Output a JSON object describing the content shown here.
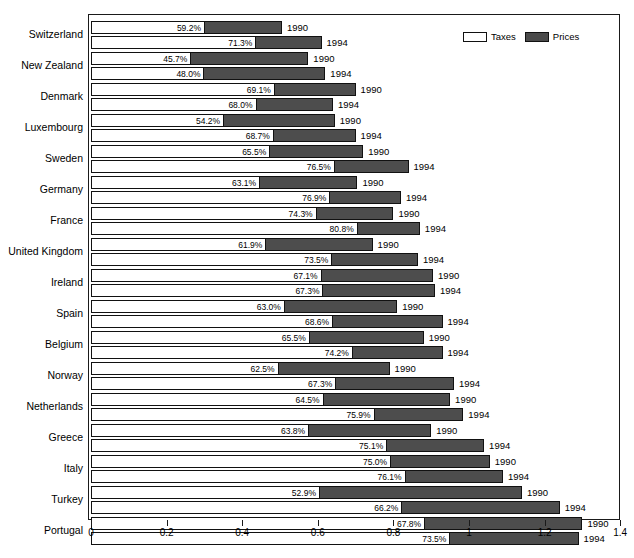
{
  "chart_data": {
    "type": "bar",
    "orientation": "horizontal",
    "stacked": true,
    "title": "",
    "xlabel": "",
    "ylabel": "",
    "xlim": [
      0,
      1.4
    ],
    "xticks": [
      "0",
      "0.2",
      "0.4",
      "0.6",
      "0.8",
      "1",
      "1.2",
      "1.4"
    ],
    "xtick_values": [
      0,
      0.2,
      0.4,
      0.6,
      0.8,
      1.0,
      1.2,
      1.4
    ],
    "grid": false,
    "legend": {
      "position": "top-right",
      "entries": [
        {
          "label": "Taxes",
          "color": "#ffffff",
          "swatch": "taxes-swatch"
        },
        {
          "label": "Prices",
          "color": "#4d4d4d",
          "swatch": "prices-swatch"
        }
      ]
    },
    "series": [
      {
        "name": "Taxes",
        "color": "#ffffff"
      },
      {
        "name": "Prices",
        "color": "#4d4d4d"
      }
    ],
    "categories": [
      "Switzerland",
      "New Zealand",
      "Denmark",
      "Luxembourg",
      "Sweden",
      "Germany",
      "France",
      "United Kingdom",
      "Ireland",
      "Spain",
      "Belgium",
      "Norway",
      "Netherlands",
      "Greece",
      "Italy",
      "Turkey",
      "Portugal"
    ],
    "rows": [
      {
        "country": "Switzerland",
        "year": "1990",
        "tax_pct": "59.2%",
        "tax_share": 0.592,
        "total": 0.505
      },
      {
        "country": "Switzerland",
        "year": "1994",
        "tax_pct": "71.3%",
        "tax_share": 0.713,
        "total": 0.61
      },
      {
        "country": "New Zealand",
        "year": "1990",
        "tax_pct": "45.7%",
        "tax_share": 0.457,
        "total": 0.575
      },
      {
        "country": "New Zealand",
        "year": "1994",
        "tax_pct": "48.0%",
        "tax_share": 0.48,
        "total": 0.62
      },
      {
        "country": "Denmark",
        "year": "1990",
        "tax_pct": "69.1%",
        "tax_share": 0.691,
        "total": 0.7
      },
      {
        "country": "Denmark",
        "year": "1994",
        "tax_pct": "68.0%",
        "tax_share": 0.68,
        "total": 0.64
      },
      {
        "country": "Luxembourg",
        "year": "1990",
        "tax_pct": "54.2%",
        "tax_share": 0.542,
        "total": 0.645
      },
      {
        "country": "Luxembourg",
        "year": "1994",
        "tax_pct": "68.7%",
        "tax_share": 0.687,
        "total": 0.7
      },
      {
        "country": "Sweden",
        "year": "1990",
        "tax_pct": "65.5%",
        "tax_share": 0.655,
        "total": 0.72
      },
      {
        "country": "Sweden",
        "year": "1994",
        "tax_pct": "76.5%",
        "tax_share": 0.765,
        "total": 0.84
      },
      {
        "country": "Germany",
        "year": "1990",
        "tax_pct": "63.1%",
        "tax_share": 0.631,
        "total": 0.705
      },
      {
        "country": "Germany",
        "year": "1994",
        "tax_pct": "76.9%",
        "tax_share": 0.769,
        "total": 0.82
      },
      {
        "country": "France",
        "year": "1990",
        "tax_pct": "74.3%",
        "tax_share": 0.743,
        "total": 0.8
      },
      {
        "country": "France",
        "year": "1994",
        "tax_pct": "80.8%",
        "tax_share": 0.808,
        "total": 0.87
      },
      {
        "country": "United Kingdom",
        "year": "1990",
        "tax_pct": "61.9%",
        "tax_share": 0.619,
        "total": 0.745
      },
      {
        "country": "United Kingdom",
        "year": "1994",
        "tax_pct": "73.5%",
        "tax_share": 0.735,
        "total": 0.865
      },
      {
        "country": "Ireland",
        "year": "1990",
        "tax_pct": "67.1%",
        "tax_share": 0.671,
        "total": 0.905
      },
      {
        "country": "Ireland",
        "year": "1994",
        "tax_pct": "67.3%",
        "tax_share": 0.673,
        "total": 0.91
      },
      {
        "country": "Spain",
        "year": "1990",
        "tax_pct": "63.0%",
        "tax_share": 0.63,
        "total": 0.81
      },
      {
        "country": "Spain",
        "year": "1994",
        "tax_pct": "68.6%",
        "tax_share": 0.686,
        "total": 0.93
      },
      {
        "country": "Belgium",
        "year": "1990",
        "tax_pct": "65.5%",
        "tax_share": 0.655,
        "total": 0.88
      },
      {
        "country": "Belgium",
        "year": "1994",
        "tax_pct": "74.2%",
        "tax_share": 0.742,
        "total": 0.93
      },
      {
        "country": "Norway",
        "year": "1990",
        "tax_pct": "62.5%",
        "tax_share": 0.625,
        "total": 0.79
      },
      {
        "country": "Norway",
        "year": "1994",
        "tax_pct": "67.3%",
        "tax_share": 0.673,
        "total": 0.96
      },
      {
        "country": "Netherlands",
        "year": "1990",
        "tax_pct": "64.5%",
        "tax_share": 0.645,
        "total": 0.95
      },
      {
        "country": "Netherlands",
        "year": "1994",
        "tax_pct": "75.9%",
        "tax_share": 0.759,
        "total": 0.985
      },
      {
        "country": "Greece",
        "year": "1990",
        "tax_pct": "63.8%",
        "tax_share": 0.638,
        "total": 0.9
      },
      {
        "country": "Greece",
        "year": "1994",
        "tax_pct": "75.1%",
        "tax_share": 0.751,
        "total": 1.04
      },
      {
        "country": "Italy",
        "year": "1990",
        "tax_pct": "75.0%",
        "tax_share": 0.75,
        "total": 1.055
      },
      {
        "country": "Italy",
        "year": "1994",
        "tax_pct": "76.1%",
        "tax_share": 0.761,
        "total": 1.09
      },
      {
        "country": "Turkey",
        "year": "1990",
        "tax_pct": "52.9%",
        "tax_share": 0.529,
        "total": 1.14
      },
      {
        "country": "Turkey",
        "year": "1994",
        "tax_pct": "66.2%",
        "tax_share": 0.662,
        "total": 1.24
      },
      {
        "country": "Portugal",
        "year": "1990",
        "tax_pct": "67.8%",
        "tax_share": 0.678,
        "total": 1.3
      },
      {
        "country": "Portugal",
        "year": "1994",
        "tax_pct": "73.5%",
        "tax_share": 0.735,
        "total": 1.29
      }
    ]
  }
}
